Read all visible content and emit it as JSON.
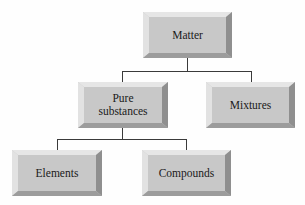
{
  "diagram": {
    "type": "hierarchy-tree",
    "title": "",
    "colors": {
      "box_face": "#c8c8c8",
      "bevel_light": "#e6e6e6",
      "bevel_dark": "#8f8f8f",
      "connector": "#3a3a3a",
      "background": "#fefefe"
    },
    "nodes": {
      "matter": {
        "label": "Matter"
      },
      "pure_substances": {
        "label": "Pure\nsubstances"
      },
      "mixtures": {
        "label": "Mixtures"
      },
      "elements": {
        "label": "Elements"
      },
      "compounds": {
        "label": "Compounds"
      }
    },
    "edges": [
      {
        "from": "Matter",
        "to": "Pure substances"
      },
      {
        "from": "Matter",
        "to": "Mixtures"
      },
      {
        "from": "Pure substances",
        "to": "Elements"
      },
      {
        "from": "Pure substances",
        "to": "Compounds"
      }
    ]
  }
}
